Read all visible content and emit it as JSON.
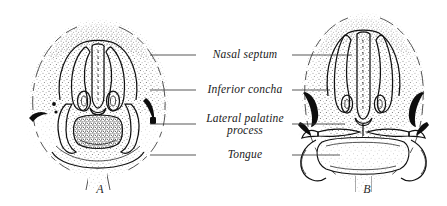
{
  "figure": {
    "type": "anatomical-illustration",
    "technique": "stippled pen-and-ink halftone",
    "background_color": "#ffffff",
    "ink_color": "#141414",
    "leader_color": "#3a3a3a"
  },
  "labels": [
    {
      "id": "nasal-septum",
      "text": "Nasal septum",
      "text2": "",
      "y": 58,
      "multiline": false
    },
    {
      "id": "inferior-concha",
      "text": "Inferior concha",
      "text2": "",
      "y": 93,
      "multiline": false
    },
    {
      "id": "lateral-palatine-process",
      "text": "Lateral palatine",
      "text2": "process",
      "y": 122,
      "multiline": true
    },
    {
      "id": "tongue",
      "text": "Tongue",
      "text2": "",
      "y": 158,
      "multiline": false
    }
  ],
  "panels": [
    {
      "id": "panel-a",
      "letter": "A",
      "letter_x": 100,
      "letter_y": 193,
      "description": "Earlier stage: lateral palatine processes directed vertically downward alongside the tongue, which lies high between them"
    },
    {
      "id": "panel-b",
      "letter": "B",
      "letter_x": 367,
      "letter_y": 193,
      "description": "Later stage: tongue has descended and flattened; lateral palatine processes have elevated to a horizontal position"
    }
  ],
  "leaders": {
    "left_column_end": 196,
    "right_column_start": 292,
    "left_starts": [
      150,
      150,
      150,
      150
    ],
    "right_ends": [
      352,
      330,
      345,
      340
    ]
  }
}
